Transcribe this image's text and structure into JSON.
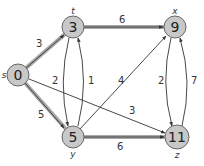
{
  "colors": {
    "node_fill": "#c8c8c8",
    "node_stroke": "#666666",
    "edge": "#333333",
    "shaded_edge": "#9a9a9a"
  },
  "nodes": [
    {
      "id": "s",
      "name": "s",
      "value": "0",
      "x": 18,
      "y": 75,
      "label_dx": -12,
      "label_dy": 0
    },
    {
      "id": "t",
      "name": "t",
      "value": "3",
      "x": 73,
      "y": 27,
      "label_dx": 0,
      "label_dy": -15
    },
    {
      "id": "x",
      "name": "x",
      "value": "9",
      "x": 175,
      "y": 27,
      "label_dx": 0,
      "label_dy": -15
    },
    {
      "id": "y",
      "name": "y",
      "value": "5",
      "x": 73,
      "y": 137,
      "label_dx": 0,
      "label_dy": 15
    },
    {
      "id": "z",
      "name": "z",
      "value": "11",
      "x": 177,
      "y": 137,
      "label_dx": 0,
      "label_dy": 15
    }
  ],
  "edges": [
    {
      "from": "s",
      "to": "t",
      "weight": "3",
      "shaded": true
    },
    {
      "from": "s",
      "to": "y",
      "weight": "5",
      "shaded": true
    },
    {
      "from": "t",
      "to": "x",
      "weight": "6",
      "shaded": true
    },
    {
      "from": "y",
      "to": "z",
      "weight": "6",
      "shaded": true
    },
    {
      "from": "t",
      "to": "y",
      "weight": "2",
      "shaded": false
    },
    {
      "from": "y",
      "to": "t",
      "weight": "1",
      "shaded": false
    },
    {
      "from": "y",
      "to": "x",
      "weight": "4",
      "shaded": false
    },
    {
      "from": "s",
      "to": "z",
      "weight": "3",
      "shaded": false
    },
    {
      "from": "x",
      "to": "z",
      "weight": "2",
      "shaded": false
    },
    {
      "from": "z",
      "to": "x",
      "weight": "7",
      "shaded": false
    }
  ]
}
